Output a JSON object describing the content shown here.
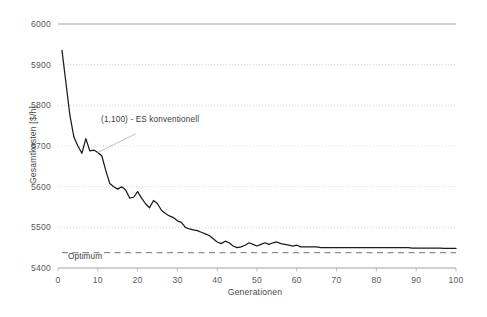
{
  "chart_data": {
    "type": "line",
    "title": "",
    "xlabel": "Generationen",
    "ylabel": "Gesamtkosten [$/h]",
    "xlim": [
      0,
      100
    ],
    "ylim": [
      5400,
      6000
    ],
    "xticks": [
      "0",
      "10",
      "20",
      "30",
      "40",
      "50",
      "60",
      "70",
      "80",
      "90",
      "100"
    ],
    "yticks": [
      "5400",
      "5500",
      "5600",
      "5700",
      "5800",
      "5900",
      "6000"
    ],
    "grid": "horizontal-dotted",
    "legend_position": "none",
    "annotations": [
      {
        "id": "series-callout",
        "text": "(1,100) - ES konventionell",
        "x": 10,
        "y": 5745
      },
      {
        "id": "optimum-label",
        "text": "Optimum",
        "x": 3,
        "y": 5418
      }
    ],
    "reference_lines": [
      {
        "name": "Optimum",
        "value": 5438,
        "style": "dashed",
        "color": "#8e8e8e"
      }
    ],
    "series": [
      {
        "name": "(1,100) - ES konventionell",
        "color": "#1a1a1a",
        "x": [
          1,
          2,
          3,
          4,
          5,
          6,
          7,
          8,
          9,
          10,
          11,
          12,
          13,
          14,
          15,
          16,
          17,
          18,
          19,
          20,
          21,
          22,
          23,
          24,
          25,
          26,
          27,
          28,
          29,
          30,
          31,
          32,
          33,
          34,
          35,
          36,
          37,
          38,
          39,
          40,
          41,
          42,
          43,
          44,
          45,
          46,
          47,
          48,
          49,
          50,
          51,
          52,
          53,
          54,
          55,
          56,
          57,
          58,
          59,
          60,
          61,
          62,
          63,
          64,
          65,
          66,
          67,
          68,
          69,
          70,
          71,
          72,
          73,
          74,
          75,
          76,
          77,
          78,
          79,
          80,
          81,
          82,
          83,
          84,
          85,
          86,
          87,
          88,
          89,
          90,
          91,
          92,
          93,
          94,
          95,
          96,
          97,
          98,
          99,
          100
        ],
        "values": [
          5935,
          5855,
          5775,
          5722,
          5700,
          5682,
          5718,
          5688,
          5690,
          5684,
          5676,
          5640,
          5608,
          5600,
          5594,
          5600,
          5592,
          5572,
          5574,
          5588,
          5572,
          5558,
          5548,
          5566,
          5558,
          5542,
          5534,
          5528,
          5524,
          5516,
          5512,
          5500,
          5496,
          5494,
          5492,
          5488,
          5484,
          5480,
          5472,
          5464,
          5460,
          5466,
          5462,
          5454,
          5450,
          5452,
          5456,
          5462,
          5458,
          5454,
          5458,
          5462,
          5458,
          5462,
          5464,
          5460,
          5458,
          5456,
          5454,
          5456,
          5452,
          5452,
          5452,
          5452,
          5452,
          5450,
          5450,
          5450,
          5450,
          5450,
          5450,
          5450,
          5450,
          5450,
          5450,
          5450,
          5450,
          5450,
          5450,
          5450,
          5450,
          5450,
          5450,
          5450,
          5450,
          5450,
          5450,
          5450,
          5449,
          5449,
          5449,
          5449,
          5449,
          5449,
          5449,
          5449,
          5448,
          5448,
          5448,
          5448
        ]
      }
    ]
  }
}
